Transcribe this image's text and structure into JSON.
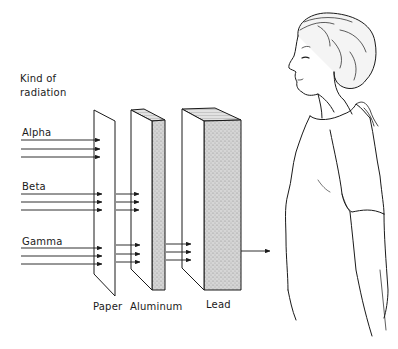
{
  "header": {
    "line1": "Kind of",
    "line2": "radiation"
  },
  "radiation_types": [
    {
      "label": "Alpha",
      "stopped_by": "Paper"
    },
    {
      "label": "Beta",
      "stopped_by": "Aluminum"
    },
    {
      "label": "Gamma",
      "stopped_by": "Lead (partially passes)"
    }
  ],
  "barriers": [
    {
      "label": "Paper"
    },
    {
      "label": "Aluminum"
    },
    {
      "label": "Lead"
    }
  ],
  "colors": {
    "line": "#1a1a1a",
    "shade": "#cfcfcf",
    "background": "#ffffff"
  }
}
